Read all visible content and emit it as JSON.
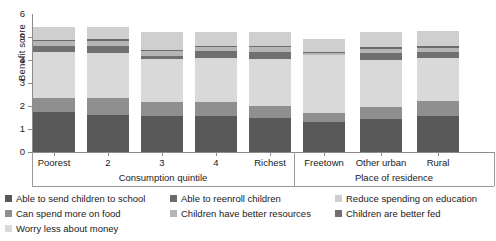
{
  "chart_data": {
    "type": "bar",
    "stacked": true,
    "title": "",
    "xlabel": "",
    "ylabel": "Benefit score",
    "ylim": [
      0,
      6
    ],
    "yticks": [
      0,
      1,
      2,
      3,
      4,
      5,
      6
    ],
    "grid": false,
    "legend_position": "bottom",
    "categories": [
      "Poorest",
      "2",
      "3",
      "4",
      "Richest",
      "Freetown",
      "Other urban",
      "Rural"
    ],
    "groups": [
      {
        "title": "Consumption quintile",
        "categories": [
          "Poorest",
          "2",
          "3",
          "4",
          "Richest"
        ]
      },
      {
        "title": "Place of residence",
        "categories": [
          "Freetown",
          "Other urban",
          "Rural"
        ]
      }
    ],
    "series": [
      {
        "name": "Able to send children to school",
        "color": "#595959",
        "values": [
          1.75,
          1.62,
          1.55,
          1.55,
          1.5,
          1.32,
          1.42,
          1.55
        ]
      },
      {
        "name": "Can spend more on food",
        "color": "#8f8f8f",
        "values": [
          0.62,
          0.72,
          0.62,
          0.62,
          0.48,
          0.38,
          0.52,
          0.68
        ]
      },
      {
        "name": "Worry less about money",
        "color": "#d9d9d9",
        "values": [
          1.98,
          1.98,
          1.88,
          1.9,
          2.05,
          2.5,
          2.05,
          1.85
        ]
      },
      {
        "name": "Children are better fed",
        "color": "#707070",
        "values": [
          0.28,
          0.3,
          0.14,
          0.32,
          0.34,
          0.0,
          0.3,
          0.25
        ]
      },
      {
        "name": "Children have better resources",
        "color": "#b5b5b5",
        "values": [
          0.2,
          0.22,
          0.2,
          0.18,
          0.18,
          0.1,
          0.2,
          0.2
        ]
      },
      {
        "name": "Able to reenroll children",
        "color": "#6b6b6b",
        "values": [
          0.06,
          0.08,
          0.06,
          0.06,
          0.06,
          0.04,
          0.06,
          0.06
        ]
      },
      {
        "name": "Reduce spending on education",
        "color": "#cfcfcf",
        "values": [
          0.56,
          0.53,
          0.75,
          0.57,
          0.59,
          0.56,
          0.65,
          0.66
        ]
      }
    ]
  },
  "legend": {
    "items": [
      {
        "label": "Able to send children to school",
        "color": "#595959"
      },
      {
        "label": "Able to reenroll children",
        "color": "#6b6b6b"
      },
      {
        "label": "Reduce spending on education",
        "color": "#cfcfcf"
      },
      {
        "label": "Can spend more on food",
        "color": "#8f8f8f"
      },
      {
        "label": "Children have better resources",
        "color": "#b5b5b5"
      },
      {
        "label": "Children are better fed",
        "color": "#707070"
      },
      {
        "label": "Worry less about money",
        "color": "#d9d9d9"
      }
    ]
  }
}
